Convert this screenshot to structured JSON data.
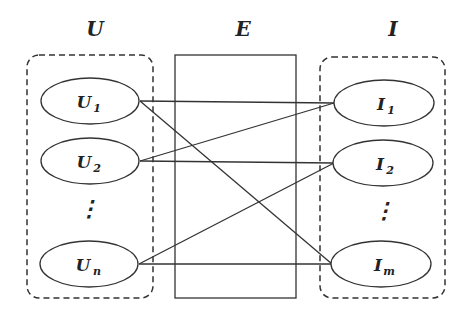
{
  "groups": {
    "users": {
      "label": "U"
    },
    "edges": {
      "label": "E"
    },
    "items": {
      "label": "I"
    }
  },
  "users": [
    {
      "id": "U1",
      "base": "U",
      "sub": "1"
    },
    {
      "id": "U2",
      "base": "U",
      "sub": "2"
    },
    {
      "id": "Un",
      "base": "U",
      "sub": "n"
    }
  ],
  "items": [
    {
      "id": "I1",
      "base": "I",
      "sub": "1"
    },
    {
      "id": "I2",
      "base": "I",
      "sub": "2"
    },
    {
      "id": "Im",
      "base": "I",
      "sub": "m"
    }
  ],
  "ellipsis": "⋮",
  "edges": [
    [
      "U1",
      "I1"
    ],
    [
      "U1",
      "Im"
    ],
    [
      "U2",
      "I1"
    ],
    [
      "U2",
      "I2"
    ],
    [
      "Un",
      "I2"
    ],
    [
      "Un",
      "Im"
    ]
  ],
  "colors": {
    "stroke": "#333333",
    "text": "#222222",
    "background": "#ffffff"
  }
}
